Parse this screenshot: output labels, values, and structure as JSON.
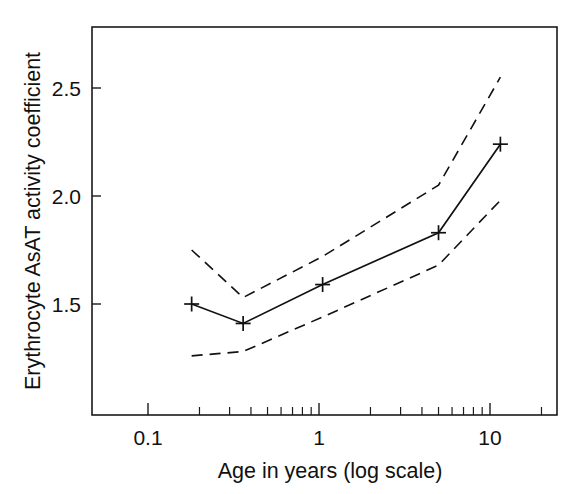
{
  "chart_data": {
    "type": "line",
    "title": "",
    "xlabel": "Age in years (log scale)",
    "ylabel": "Erythrocyte AsAT activity coefficient",
    "xscale": "log",
    "xlim": [
      0.1,
      15.8
    ],
    "ylim": [
      1.17,
      2.7
    ],
    "grid": false,
    "legend": "none",
    "x_tick_labels": [
      "0.1",
      "1",
      "10"
    ],
    "x_tick_values": [
      0.1,
      1,
      10
    ],
    "y_tick_labels": [
      "1.5",
      "2.0",
      "2.5"
    ],
    "y_tick_values": [
      1.5,
      2.0,
      2.5
    ],
    "x": [
      0.18,
      0.36,
      1.05,
      5.0,
      11.5
    ],
    "series": [
      {
        "name": "Mean AsAT activity coefficient",
        "style": "solid",
        "marker": "plus",
        "values": [
          1.5,
          1.41,
          1.59,
          1.83,
          2.24
        ]
      },
      {
        "name": "Upper confidence limit",
        "style": "dashed",
        "marker": "none",
        "values": [
          1.75,
          1.53,
          1.72,
          2.05,
          2.55
        ]
      },
      {
        "name": "Lower confidence limit",
        "style": "dashed",
        "marker": "none",
        "values": [
          1.26,
          1.28,
          1.44,
          1.68,
          1.98
        ]
      }
    ]
  },
  "figure": {
    "xlabel": "Age in years (log scale)",
    "ylabel": "Erythrocyte AsAT activity coefficient",
    "x_labels": [
      "0.1",
      "1",
      "10"
    ],
    "y_labels": [
      "1.5",
      "2.0",
      "2.5"
    ]
  }
}
